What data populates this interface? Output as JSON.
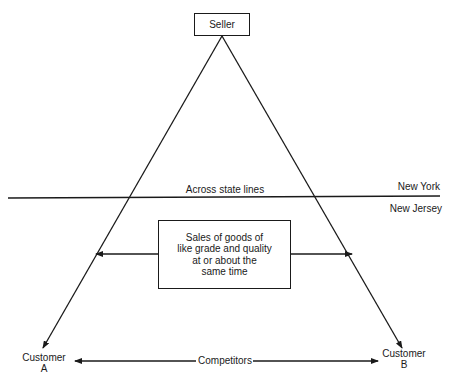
{
  "diagram": {
    "seller": "Seller",
    "state_line_label": "Across state lines",
    "state_top": "New York",
    "state_bottom": "New Jersey",
    "center_box": [
      "Sales of goods of",
      "like grade and quality",
      "at or about the",
      "same time"
    ],
    "customer_a": [
      "Customer",
      "A"
    ],
    "customer_b": [
      "Customer",
      "B"
    ],
    "competitors": "Competitors"
  },
  "colors": {
    "ink": "#1a1a1a",
    "background": "#ffffff"
  }
}
